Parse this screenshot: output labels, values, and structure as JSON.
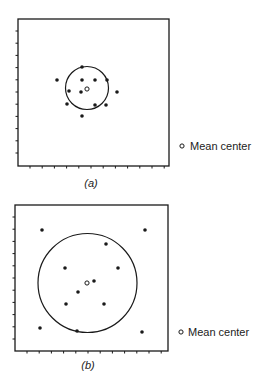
{
  "figure": {
    "panels": [
      {
        "id": "a",
        "label": "(a)",
        "legend": {
          "symbol": "open-circle",
          "text": "Mean center"
        },
        "frame": {
          "x": 18,
          "y": 19,
          "w": 151,
          "h": 147
        },
        "tick_spacing": 12.2,
        "mean_center": {
          "x": 87,
          "y": 89
        },
        "circle": {
          "cx": 87,
          "cy": 88,
          "r": 21.5
        },
        "points": [
          {
            "x": 82,
            "y": 67
          },
          {
            "x": 57,
            "y": 80
          },
          {
            "x": 82,
            "y": 80
          },
          {
            "x": 95,
            "y": 80
          },
          {
            "x": 107,
            "y": 80
          },
          {
            "x": 69,
            "y": 91
          },
          {
            "x": 81,
            "y": 92
          },
          {
            "x": 117,
            "y": 92
          },
          {
            "x": 67,
            "y": 104
          },
          {
            "x": 95,
            "y": 105
          },
          {
            "x": 106,
            "y": 105
          },
          {
            "x": 82,
            "y": 116
          }
        ]
      },
      {
        "id": "b",
        "label": "(b)",
        "legend": {
          "symbol": "open-circle",
          "text": "Mean center"
        },
        "frame": {
          "x": 15,
          "y": 205,
          "w": 153,
          "h": 146
        },
        "tick_spacing": 12.2,
        "mean_center": {
          "x": 87,
          "y": 283
        },
        "circle": {
          "cx": 87.5,
          "cy": 283,
          "r": 49.5
        },
        "points": [
          {
            "x": 42,
            "y": 230
          },
          {
            "x": 145,
            "y": 230
          },
          {
            "x": 106,
            "y": 244
          },
          {
            "x": 65,
            "y": 268
          },
          {
            "x": 118,
            "y": 268
          },
          {
            "x": 94,
            "y": 281
          },
          {
            "x": 78,
            "y": 292
          },
          {
            "x": 66,
            "y": 304
          },
          {
            "x": 104,
            "y": 304
          },
          {
            "x": 40,
            "y": 328
          },
          {
            "x": 77,
            "y": 331
          },
          {
            "x": 142,
            "y": 332
          }
        ]
      }
    ],
    "legend_positions": [
      {
        "sym_x": 182,
        "sym_y": 146,
        "text_x": 190,
        "text_y": 150
      },
      {
        "sym_x": 181,
        "sym_y": 332,
        "text_x": 188,
        "text_y": 336
      }
    ],
    "label_positions": [
      {
        "x": 91,
        "y": 187
      },
      {
        "x": 88,
        "y": 369
      }
    ],
    "colors": {
      "ink": "#1a1a1a",
      "background": "#ffffff"
    }
  }
}
